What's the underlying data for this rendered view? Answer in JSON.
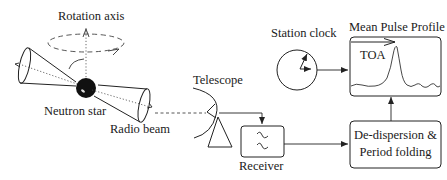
{
  "diagram": {
    "labels": {
      "rotation_axis": "Rotation axis",
      "neutron_star": "Neutron star",
      "radio_beam": "Radio beam",
      "telescope": "Telescope",
      "receiver": "Receiver",
      "station_clock": "Station clock",
      "mean_pulse_profile": "Mean Pulse Profile",
      "toa": "TOA",
      "dedispersion_line1": "De-dispersion &",
      "dedispersion_line2": "Period folding"
    },
    "nodes": [
      {
        "id": "neutron_star",
        "label": "Neutron star"
      },
      {
        "id": "telescope",
        "label": "Telescope"
      },
      {
        "id": "receiver",
        "label": "Receiver"
      },
      {
        "id": "dedispersion",
        "label": "De-dispersion & Period folding"
      },
      {
        "id": "station_clock",
        "label": "Station clock"
      },
      {
        "id": "mean_pulse_profile",
        "label": "Mean Pulse Profile"
      }
    ],
    "edges": [
      {
        "from": "neutron_star",
        "to": "telescope",
        "style": "dashed"
      },
      {
        "from": "telescope",
        "to": "receiver",
        "style": "solid-arrow"
      },
      {
        "from": "receiver",
        "to": "dedispersion",
        "style": "solid-arrow"
      },
      {
        "from": "dedispersion",
        "to": "mean_pulse_profile",
        "style": "solid-arrow"
      },
      {
        "from": "station_clock",
        "to": "mean_pulse_profile",
        "style": "solid-arrow"
      }
    ],
    "colors": {
      "stroke": "#222222",
      "background": "#ffffff"
    }
  }
}
